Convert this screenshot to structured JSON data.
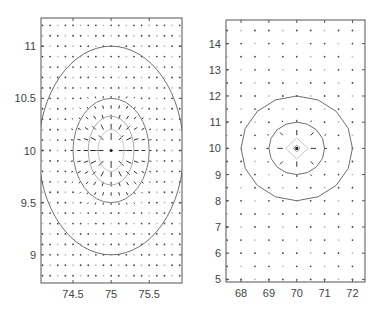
{
  "chart_data": [
    {
      "type": "contour+quiver",
      "title": "",
      "xlabel": "",
      "ylabel": "",
      "xlim": [
        74.08,
        75.93
      ],
      "ylim": [
        8.73,
        11.27
      ],
      "xticks": [
        74.5,
        75,
        75.5
      ],
      "xtick_labels": [
        "74.5",
        "75",
        "75.5"
      ],
      "yticks": [
        9,
        9.5,
        10,
        10.5,
        11
      ],
      "ytick_labels": [
        "9",
        "9.5",
        "10",
        "10.5",
        "11"
      ],
      "grid": false,
      "center": [
        75,
        10
      ],
      "contours": [
        {
          "rx": 0.95,
          "ry": 1.0,
          "color": "#6e6e6e"
        },
        {
          "rx": 0.5,
          "ry": 0.5,
          "color": "#7a7a7a"
        },
        {
          "rx": 0.3,
          "ry": 0.33,
          "color": "#aaaaaa"
        },
        {
          "rx": 0.17,
          "ry": 0.2,
          "color": "#c8c8c8"
        }
      ],
      "quiver": {
        "x_start": 74.1,
        "x_end": 75.9,
        "x_step": 0.1,
        "y_start": 8.8,
        "y_end": 11.2,
        "y_step": 0.1,
        "direction": "toward-center",
        "arrow_color": "#333333"
      }
    },
    {
      "type": "contour+quiver",
      "title": "",
      "xlabel": "",
      "ylabel": "",
      "xlim": [
        67.46,
        72.45
      ],
      "ylim": [
        4.9,
        14.9
      ],
      "xticks": [
        68,
        69,
        70,
        71,
        72
      ],
      "xtick_labels": [
        "68",
        "69",
        "70",
        "71",
        "72"
      ],
      "yticks": [
        5,
        6,
        7,
        8,
        9,
        10,
        11,
        12,
        13,
        14
      ],
      "ytick_labels": [
        "5",
        "6",
        "7",
        "8",
        "9",
        "10",
        "11",
        "12",
        "13",
        "14"
      ],
      "grid": false,
      "center": [
        70,
        10
      ],
      "contours": [
        {
          "rx": 2.0,
          "ry": 2.0,
          "color": "#6e6e6e",
          "shape": "polygon"
        },
        {
          "rx": 1.0,
          "ry": 1.0,
          "color": "#6e6e6e",
          "shape": "polygon"
        },
        {
          "rx": 0.4,
          "ry": 0.4,
          "color": "#c8c8c8",
          "shape": "diamond"
        },
        {
          "rx": 0.12,
          "ry": 0.12,
          "color": "#888888",
          "shape": "diamond"
        }
      ],
      "quiver": {
        "x_start": 67.5,
        "x_end": 72.0,
        "x_step": 0.5,
        "y_start": 5.0,
        "y_end": 14.5,
        "y_step": 0.5,
        "direction": "toward-center",
        "arrow_color": "#333333"
      }
    }
  ],
  "panels": [
    {
      "name": "left-panel",
      "box": {
        "x": 41,
        "y": 18,
        "w": 141,
        "h": 265
      }
    },
    {
      "name": "right-panel",
      "box": {
        "x": 226,
        "y": 20,
        "w": 139,
        "h": 262
      }
    }
  ]
}
